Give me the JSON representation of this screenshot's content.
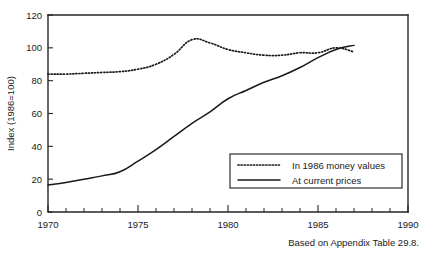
{
  "figure": {
    "cut_off_title": "",
    "caption": "Based on Appendix Table 29.8."
  },
  "chart_data": {
    "type": "line",
    "title": "",
    "xlabel": "",
    "ylabel": "Index (1986=100)",
    "xlim": [
      1970,
      1990
    ],
    "ylim": [
      0,
      120
    ],
    "xticks": [
      1970,
      1975,
      1980,
      1985,
      1990
    ],
    "xtick_labels": [
      "1970",
      "1975",
      "1980",
      "1985",
      "1990"
    ],
    "x_minor_tick_interval": 1,
    "yticks": [
      0,
      20,
      40,
      60,
      80,
      100,
      120
    ],
    "ytick_labels": [
      "0",
      "20",
      "40",
      "60",
      "80",
      "100",
      "120"
    ],
    "grid": false,
    "legend_position": "lower right",
    "x": [
      1970,
      1971,
      1972,
      1973,
      1974,
      1975,
      1976,
      1977,
      1978,
      1979,
      1980,
      1981,
      1982,
      1983,
      1984,
      1985,
      1986,
      1987
    ],
    "series": [
      {
        "name": "In 1986 money values",
        "style": "dotted",
        "color": "#1a1a1a",
        "values": [
          84,
          84,
          84.5,
          85,
          85.5,
          87,
          90,
          96,
          105,
          103,
          99,
          97,
          95.5,
          95.5,
          97,
          97,
          100,
          97.5
        ]
      },
      {
        "name": "At current prices",
        "style": "solid",
        "color": "#1a1a1a",
        "values": [
          16.5,
          18,
          20,
          22,
          24.5,
          31,
          38,
          46,
          54,
          61,
          69,
          74,
          79,
          83,
          88,
          94,
          99,
          101.5
        ]
      }
    ]
  },
  "legend": {
    "entries": [
      {
        "label": "In 1986 money values",
        "style": "dotted"
      },
      {
        "label": "At current prices",
        "style": "solid"
      }
    ]
  }
}
